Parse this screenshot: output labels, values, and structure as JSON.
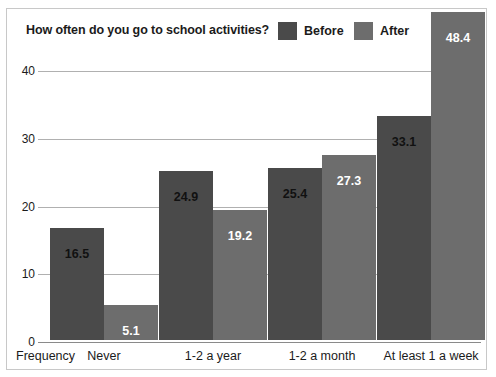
{
  "chart_data": {
    "type": "bar",
    "title": "How often do you go to school activities?",
    "xlabel": "Frequency",
    "ylabel": "",
    "categories": [
      "Never",
      "1-2 a year",
      "1-2 a month",
      "At least 1 a week"
    ],
    "series": [
      {
        "name": "Before",
        "color": "#4a4a4a",
        "values": [
          16.5,
          24.9,
          25.4,
          33.1
        ]
      },
      {
        "name": "After",
        "color": "#6d6d6d",
        "values": [
          5.1,
          19.2,
          27.3,
          48.4
        ]
      }
    ],
    "ylim": [
      0,
      48.4
    ],
    "yticks": [
      0,
      10,
      20,
      30,
      40
    ],
    "ytick_labels": [
      "0",
      "10",
      "20",
      "30",
      "40"
    ],
    "grid": true,
    "legend_position": "top-right"
  },
  "legend": {
    "before_label": "Before",
    "after_label": "After"
  },
  "value_labels": {
    "before": [
      "16.5",
      "24.9",
      "25.4",
      "33.1"
    ],
    "after": [
      "5.1",
      "19.2",
      "27.3",
      "48.4"
    ]
  }
}
